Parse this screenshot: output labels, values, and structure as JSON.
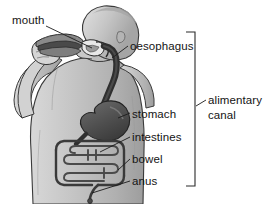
{
  "figure": {
    "type": "anatomical-diagram",
    "scene": "person eating a sandwich",
    "colors": {
      "background": "#ffffff",
      "body_fill": "#c9c9c9",
      "body_shade": "#a8a8a8",
      "body_light": "#e2e2e2",
      "organ_dark": "#4a4a4a",
      "organ_mid": "#8e8e8e",
      "outline": "#2b2b2b",
      "leader_line": "#1c1c1c",
      "text": "#141414"
    }
  },
  "labels": [
    {
      "id": "mouth",
      "text": "mouth"
    },
    {
      "id": "oesophagus",
      "text": "oesophagus"
    },
    {
      "id": "stomach",
      "text": "stomach"
    },
    {
      "id": "intestines",
      "text": "intestines"
    },
    {
      "id": "bowel",
      "text": "bowel"
    },
    {
      "id": "anus",
      "text": "anus"
    }
  ],
  "bracket": {
    "label_line_1": "alimentary",
    "label_line_2": "canal",
    "groups": [
      "oesophagus",
      "stomach",
      "intestines",
      "bowel",
      "anus"
    ]
  }
}
